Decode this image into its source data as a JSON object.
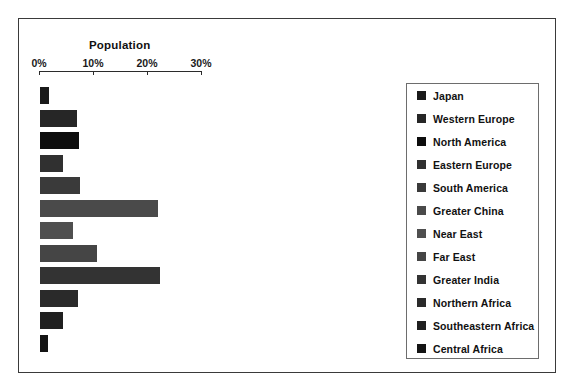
{
  "chart_data": {
    "type": "bar",
    "orientation": "horizontal",
    "title": "Population",
    "xlabel": "",
    "ylabel": "",
    "xlim": [
      0,
      30
    ],
    "xticks": [
      0,
      10,
      20,
      30
    ],
    "xtick_labels": [
      "0%",
      "10%",
      "20%",
      "30%"
    ],
    "grid": false,
    "legend_position": "right",
    "categories": [
      "Japan",
      "Western Europe",
      "North America",
      "Eastern Europe",
      "South America",
      "Greater China",
      "Near East",
      "Far East",
      "Greater India",
      "Northern Africa",
      "Southeastern Africa",
      "Central Africa"
    ],
    "values": [
      2.0,
      7.2,
      7.6,
      4.6,
      7.8,
      22.3,
      6.4,
      11.0,
      22.6,
      7.4,
      4.6,
      1.9
    ],
    "colors": [
      "#1a1a1a",
      "#262626",
      "#0d0d0d",
      "#303030",
      "#3a3a3a",
      "#4a4a4a",
      "#4f4f4f",
      "#454545",
      "#333333",
      "#2a2a2a",
      "#202020",
      "#141414"
    ]
  }
}
